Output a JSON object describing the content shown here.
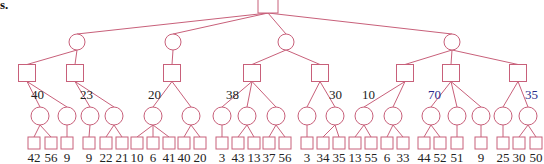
{
  "corner_text": "s.",
  "colors": {
    "edge": "#c8607a",
    "label_default": "#222222",
    "label_highlight": "#2a2a8a"
  },
  "tree": {
    "root": {
      "type": "decision",
      "x": 268,
      "y": 6
    },
    "level1": [
      {
        "type": "chance",
        "x": 77,
        "y": 42
      },
      {
        "type": "chance",
        "x": 173,
        "y": 42
      },
      {
        "type": "chance",
        "x": 286,
        "y": 42
      },
      {
        "type": "chance",
        "x": 452,
        "y": 42
      }
    ],
    "level2": [
      {
        "type": "decision",
        "parent": 0,
        "x": 27,
        "y": 73,
        "value": "40",
        "label_x": 31,
        "label_y": 99,
        "highlight": false
      },
      {
        "type": "decision",
        "parent": 0,
        "x": 75,
        "y": 73,
        "value": "23",
        "label_x": 80,
        "label_y": 99,
        "highlight": false
      },
      {
        "type": "decision",
        "parent": 1,
        "x": 172,
        "y": 73,
        "value": "20",
        "label_x": 148,
        "label_y": 99,
        "highlight": false
      },
      {
        "type": "decision",
        "parent": 2,
        "x": 252,
        "y": 73,
        "value": "38",
        "label_x": 226,
        "label_y": 99,
        "highlight": false
      },
      {
        "type": "decision",
        "parent": 2,
        "x": 320,
        "y": 73,
        "value": "30",
        "label_x": 329,
        "label_y": 99,
        "highlight": false
      },
      {
        "type": "decision",
        "parent": 3,
        "x": 405,
        "y": 73,
        "value": "10",
        "label_x": 362,
        "label_y": 99,
        "highlight": false
      },
      {
        "type": "decision",
        "parent": 3,
        "x": 451,
        "y": 73,
        "value": "70",
        "label_x": 428,
        "label_y": 99,
        "highlight": true
      },
      {
        "type": "decision",
        "parent": 3,
        "x": 518,
        "y": 73,
        "value": "35",
        "label_x": 525,
        "label_y": 99,
        "highlight": true
      }
    ],
    "level3": [
      {
        "parent": 0,
        "x": 40,
        "y": 116
      },
      {
        "parent": 0,
        "x": 67,
        "y": 116
      },
      {
        "parent": 1,
        "x": 90,
        "y": 116
      },
      {
        "parent": 1,
        "x": 114,
        "y": 116
      },
      {
        "parent": 2,
        "x": 153,
        "y": 116
      },
      {
        "parent": 2,
        "x": 191,
        "y": 116
      },
      {
        "parent": 3,
        "x": 222,
        "y": 116
      },
      {
        "parent": 3,
        "x": 247,
        "y": 116
      },
      {
        "parent": 3,
        "x": 276,
        "y": 116
      },
      {
        "parent": 4,
        "x": 307,
        "y": 116
      },
      {
        "parent": 4,
        "x": 335,
        "y": 116
      },
      {
        "parent": 5,
        "x": 364,
        "y": 116
      },
      {
        "parent": 5,
        "x": 393,
        "y": 116
      },
      {
        "parent": 6,
        "x": 431,
        "y": 116
      },
      {
        "parent": 6,
        "x": 457,
        "y": 116
      },
      {
        "parent": 6,
        "x": 481,
        "y": 116
      },
      {
        "parent": 7,
        "x": 503,
        "y": 116
      },
      {
        "parent": 7,
        "x": 528,
        "y": 116
      }
    ],
    "leaves": [
      {
        "parent": 0,
        "x": 34,
        "value": "42"
      },
      {
        "parent": 0,
        "x": 51,
        "value": "56"
      },
      {
        "parent": 1,
        "x": 67,
        "value": "9"
      },
      {
        "parent": 2,
        "x": 89,
        "value": "9"
      },
      {
        "parent": 3,
        "x": 106,
        "value": "22"
      },
      {
        "parent": 3,
        "x": 122,
        "value": "21"
      },
      {
        "parent": 4,
        "x": 137,
        "value": "10"
      },
      {
        "parent": 4,
        "x": 153,
        "value": "6"
      },
      {
        "parent": 4,
        "x": 169,
        "value": "41"
      },
      {
        "parent": 5,
        "x": 184,
        "value": "40"
      },
      {
        "parent": 5,
        "x": 200,
        "value": "20"
      },
      {
        "parent": 6,
        "x": 222,
        "value": "3"
      },
      {
        "parent": 7,
        "x": 238,
        "value": "43"
      },
      {
        "parent": 7,
        "x": 254,
        "value": "13"
      },
      {
        "parent": 8,
        "x": 269,
        "value": "37"
      },
      {
        "parent": 8,
        "x": 285,
        "value": "56"
      },
      {
        "parent": 9,
        "x": 307,
        "value": "3"
      },
      {
        "parent": 10,
        "x": 323,
        "value": "34"
      },
      {
        "parent": 10,
        "x": 339,
        "value": "35"
      },
      {
        "parent": 11,
        "x": 355,
        "value": "13"
      },
      {
        "parent": 11,
        "x": 371,
        "value": "55"
      },
      {
        "parent": 12,
        "x": 387,
        "value": "6"
      },
      {
        "parent": 12,
        "x": 403,
        "value": "33"
      },
      {
        "parent": 13,
        "x": 424,
        "value": "44"
      },
      {
        "parent": 13,
        "x": 440,
        "value": "52"
      },
      {
        "parent": 14,
        "x": 457,
        "value": "51"
      },
      {
        "parent": 15,
        "x": 481,
        "value": "9"
      },
      {
        "parent": 16,
        "x": 503,
        "value": "25"
      },
      {
        "parent": 17,
        "x": 519,
        "value": "30"
      },
      {
        "parent": 17,
        "x": 536,
        "value": "50"
      }
    ]
  }
}
